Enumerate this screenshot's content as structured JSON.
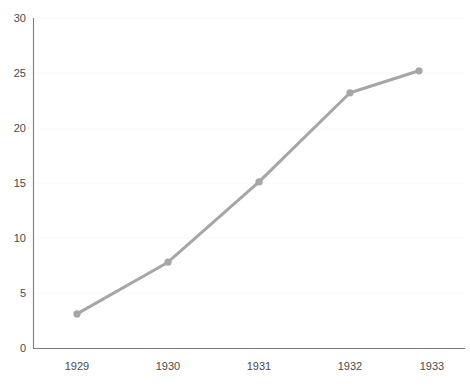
{
  "chart_data": {
    "type": "line",
    "title": "",
    "subtitle": "",
    "xlabel": "",
    "ylabel": "",
    "categories": [
      "1929",
      "1930",
      "1931",
      "1932",
      "1933"
    ],
    "values": [
      3.1,
      7.8,
      15.1,
      23.2,
      25.2
    ],
    "series": [
      {
        "name": "",
        "values": [
          3.1,
          7.8,
          15.1,
          23.2,
          25.2
        ]
      }
    ],
    "x": [
      "1929",
      "1930",
      "1931",
      "1932",
      "1933"
    ],
    "ylim": [
      0,
      30
    ],
    "ytick_labels": [
      "0",
      "5",
      "10",
      "15",
      "20",
      "25",
      "30"
    ],
    "ytick_values": [
      0,
      5,
      10,
      15,
      20,
      25,
      30
    ],
    "xtick_labels": [
      "1929",
      "1930",
      "1931",
      "1932",
      "1933"
    ],
    "grid": true,
    "grid_axis": "y",
    "legend": false,
    "legend_position": "none",
    "annotations": [],
    "colors": {
      "line": "#a6a6a6",
      "marker": "#a6a6a6",
      "axis": "#7f7f7f",
      "tick_label": "#4a4a4a",
      "gridline": "#fafafa",
      "background": "#ffffff"
    },
    "style": {
      "line_width": 3,
      "marker_shape": "circle",
      "marker_radius": 3.6
    }
  }
}
